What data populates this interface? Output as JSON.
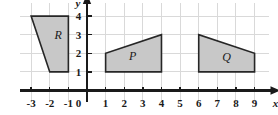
{
  "figure": {
    "type": "coordinate-grid-diagram",
    "background": "#ffffff",
    "grid_color": "#d9d9d9",
    "axis_color": "#1a1a1a",
    "shape_fill": "#c8c8c8",
    "shape_stroke": "#262626"
  },
  "axes": {
    "x": {
      "name": "x",
      "ticks": [
        "-3",
        "-2",
        "-1",
        "1",
        "2",
        "3",
        "4",
        "5",
        "6",
        "7",
        "8",
        "9"
      ],
      "tick_values": [
        -3,
        -2,
        -1,
        1,
        2,
        3,
        4,
        5,
        6,
        7,
        8,
        9
      ],
      "range": [
        -3.6,
        9.8
      ],
      "arrow": true
    },
    "y": {
      "name": "y",
      "ticks": [
        "1",
        "2",
        "3",
        "4"
      ],
      "tick_values": [
        1,
        2,
        3,
        4
      ],
      "range": [
        -0.6,
        4.7
      ],
      "arrow": true
    },
    "origin_label": "0"
  },
  "shapes": [
    {
      "label": "R",
      "vertices": [
        [
          -3,
          4
        ],
        [
          -1,
          4
        ],
        [
          -1,
          1
        ],
        [
          -2,
          1
        ]
      ],
      "label_at": [
        -1.55,
        2.75
      ]
    },
    {
      "label": "P",
      "vertices": [
        [
          1,
          1
        ],
        [
          1,
          2
        ],
        [
          4,
          3
        ],
        [
          4,
          1
        ]
      ],
      "label_at": [
        2.45,
        1.65
      ]
    },
    {
      "label": "Q",
      "vertices": [
        [
          6,
          1
        ],
        [
          6,
          3
        ],
        [
          9,
          2
        ],
        [
          9,
          1
        ]
      ],
      "label_at": [
        7.5,
        1.6
      ]
    }
  ]
}
